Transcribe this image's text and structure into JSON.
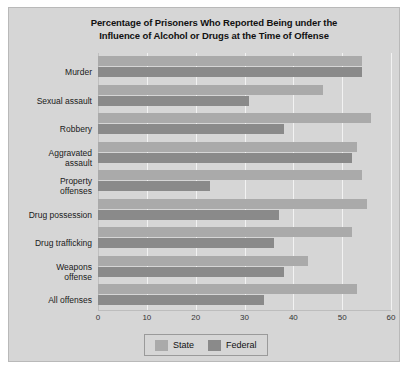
{
  "chart_data": {
    "type": "bar",
    "orientation": "horizontal",
    "title": "Percentage of Prisoners Who Reported Being under the Influence of Alcohol or Drugs at the Time of Offense",
    "title_line1": "Percentage of Prisoners Who Reported Being under the",
    "title_line2": "Influence of Alcohol or Drugs at the Time of Offense",
    "xlabel": "",
    "ylabel": "",
    "xlim": [
      0,
      60
    ],
    "xticks": [
      0,
      10,
      20,
      30,
      40,
      50,
      60
    ],
    "xtick_labels": [
      "0",
      "10",
      "20",
      "30",
      "40",
      "50",
      "60"
    ],
    "grid": true,
    "legend_position": "bottom-center",
    "categories": [
      "Murder",
      "Sexual assault",
      "Robbery",
      "Aggravated\nassault",
      "Property\noffenses",
      "Drug possession",
      "Drug trafficking",
      "Weapons\noffense",
      "All offenses"
    ],
    "series": [
      {
        "name": "State",
        "color": "#aaaaaa",
        "values": [
          54,
          46,
          56,
          53,
          54,
          55,
          52,
          43,
          53
        ]
      },
      {
        "name": "Federal",
        "color": "#8a8a8a",
        "values": [
          54,
          31,
          38,
          52,
          23,
          37,
          36,
          38,
          34
        ]
      }
    ]
  },
  "legend": {
    "entries": [
      {
        "label": "State",
        "color": "#aaaaaa"
      },
      {
        "label": "Federal",
        "color": "#8a8a8a"
      }
    ]
  },
  "colors": {
    "figure_background": "#d6d6d6",
    "page_background": "#ffffff",
    "gridline": "#f2f2f2",
    "axis": "#bdbdbd",
    "state_bar": "#aaaaaa",
    "federal_bar": "#8a8a8a"
  }
}
